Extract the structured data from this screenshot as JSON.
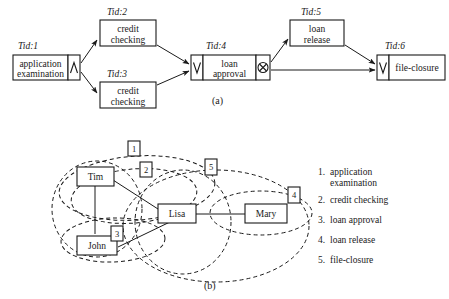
{
  "figure": {
    "caption_a": "(a)",
    "caption_b": "(b)"
  },
  "process_model": {
    "tid_prefix": "Tid:",
    "tasks": [
      {
        "id": "1",
        "tid_label": "Tid:1",
        "name_line1": "application",
        "name_line2": "examination",
        "split": "and-split",
        "split_glyph": "∧",
        "join": "none"
      },
      {
        "id": "2",
        "tid_label": "Tid:2",
        "name_line1": "credit",
        "name_line2": "checking",
        "split": "none",
        "join": "none"
      },
      {
        "id": "3",
        "tid_label": "Tid:3",
        "name_line1": "credit",
        "name_line2": "checking",
        "split": "none",
        "join": "none"
      },
      {
        "id": "4",
        "tid_label": "Tid:4",
        "name_line1": "loan",
        "name_line2": "approval",
        "join": "and-join",
        "join_glyph": "∨",
        "split": "xor-split",
        "split_glyph": "⊗"
      },
      {
        "id": "5",
        "tid_label": "Tid:5",
        "name_line1": "loan",
        "name_line2": "release",
        "split": "none",
        "join": "none"
      },
      {
        "id": "6",
        "tid_label": "Tid:6",
        "name_line1": "file-closure",
        "name_line2": "",
        "join": "xor-join",
        "join_glyph": "∨",
        "split": "none"
      }
    ],
    "arcs": [
      {
        "from": "1",
        "to": "2"
      },
      {
        "from": "1",
        "to": "3"
      },
      {
        "from": "2",
        "to": "4"
      },
      {
        "from": "3",
        "to": "4"
      },
      {
        "from": "4",
        "to": "5"
      },
      {
        "from": "4",
        "to": "6"
      },
      {
        "from": "5",
        "to": "6"
      }
    ]
  },
  "social_network": {
    "actors": [
      {
        "id": "tim",
        "label": "Tim"
      },
      {
        "id": "lisa",
        "label": "Lisa"
      },
      {
        "id": "john",
        "label": "John"
      },
      {
        "id": "mary",
        "label": "Mary"
      }
    ],
    "edges": [
      {
        "from": "tim",
        "to": "lisa"
      },
      {
        "from": "tim",
        "to": "john"
      },
      {
        "from": "john",
        "to": "lisa"
      },
      {
        "from": "lisa",
        "to": "mary"
      }
    ],
    "group_markers": [
      {
        "id": "g1",
        "label": "1"
      },
      {
        "id": "g2",
        "label": "2"
      },
      {
        "id": "g3",
        "label": "3"
      },
      {
        "id": "g4",
        "label": "4"
      },
      {
        "id": "g5",
        "label": "5"
      }
    ]
  },
  "legend": {
    "items": [
      {
        "num": "1.",
        "text_line1": "application",
        "text_line2": "examination"
      },
      {
        "num": "2.",
        "text_line1": "credit checking",
        "text_line2": ""
      },
      {
        "num": "3.",
        "text_line1": "loan approval",
        "text_line2": ""
      },
      {
        "num": "4.",
        "text_line1": "loan release",
        "text_line2": ""
      },
      {
        "num": "5.",
        "text_line1": "file-closure",
        "text_line2": ""
      }
    ]
  },
  "colors": {
    "stroke": "#1a1a1a",
    "background": "#ffffff"
  }
}
